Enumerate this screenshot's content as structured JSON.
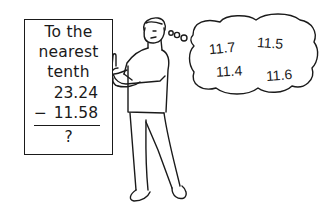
{
  "problem_card": {
    "instruction_lines": [
      "To the",
      "nearest",
      "tenth"
    ],
    "minuend": "23.24",
    "operator": "−",
    "subtrahend": "11.58",
    "answer": "?"
  },
  "thought_bubble": {
    "guesses": [
      "11.7",
      "11.5",
      "11.4",
      "11.6"
    ]
  }
}
